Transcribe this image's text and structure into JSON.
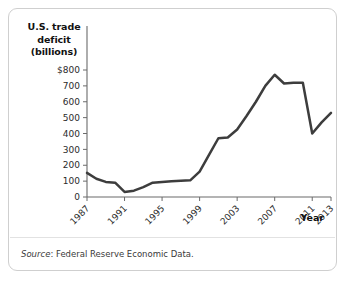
{
  "figure": {
    "y_axis_title_lines": [
      "U.S. trade",
      "deficit",
      "(billions)"
    ],
    "x_axis_title": "Year",
    "source_label": "Source",
    "source_text": ": Federal Reserve Economic Data.",
    "line_color": "#3d3d3d",
    "axis_color": "#6b6b6b",
    "border_color": "#cfcfcf",
    "background_color": "#ffffff"
  },
  "chart_data": {
    "type": "line",
    "title": "",
    "xlabel": "Year",
    "ylabel": "U.S. trade deficit (billions)",
    "xlim": [
      1987,
      2013
    ],
    "ylim": [
      0,
      800
    ],
    "grid": false,
    "legend": "none",
    "ytick_labels": [
      "$800",
      "700",
      "600",
      "500",
      "400",
      "300",
      "200",
      "100",
      "0"
    ],
    "ytick_values": [
      800,
      700,
      600,
      500,
      400,
      300,
      200,
      100,
      0
    ],
    "xtick_labels": [
      "1987",
      "1991",
      "1995",
      "1999",
      "2003",
      "2007",
      "2011",
      "2013"
    ],
    "xtick_values": [
      1987,
      1991,
      1995,
      1999,
      2003,
      2007,
      2011,
      2013
    ],
    "x": [
      1987,
      1988,
      1989,
      1990,
      1991,
      1992,
      1993,
      1994,
      1995,
      1996,
      1997,
      1998,
      1999,
      2000,
      2001,
      2002,
      2003,
      2004,
      2005,
      2006,
      2007,
      2008,
      2009,
      2010,
      2011,
      2012,
      2013
    ],
    "values": [
      152,
      115,
      95,
      90,
      32,
      40,
      62,
      90,
      95,
      100,
      103,
      105,
      160,
      265,
      370,
      375,
      425,
      510,
      600,
      700,
      770,
      715,
      720,
      720,
      400,
      470,
      530
    ],
    "series": [
      {
        "name": "U.S. trade deficit",
        "values": [
          152,
          115,
          95,
          90,
          32,
          40,
          62,
          90,
          95,
          100,
          103,
          105,
          160,
          265,
          370,
          375,
          425,
          510,
          600,
          700,
          770,
          715,
          720,
          720,
          400,
          470,
          530
        ]
      }
    ],
    "annotations": []
  }
}
